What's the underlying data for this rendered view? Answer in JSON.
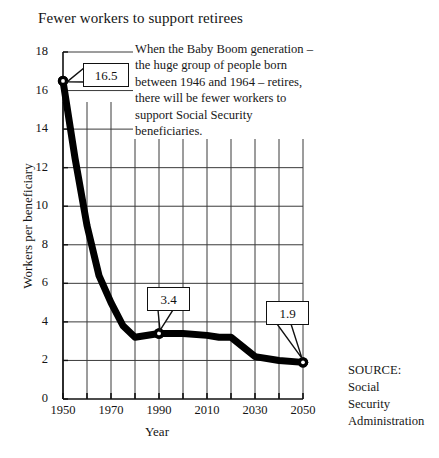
{
  "chart_data": {
    "type": "line",
    "title": "Fewer workers to support retirees",
    "xlabel": "Year",
    "ylabel": "Workers per beneficiary",
    "xlim": [
      1950,
      2050
    ],
    "ylim": [
      0,
      18
    ],
    "ytick_step": 2,
    "xtick_step": 10,
    "grid": true,
    "legend": "none",
    "x_major_ticks": [
      1950,
      1970,
      1990,
      2010,
      2030,
      2050
    ],
    "y_ticks": [
      0,
      2,
      4,
      6,
      8,
      10,
      12,
      14,
      16,
      18
    ],
    "x": [
      1950,
      1955,
      1960,
      1965,
      1970,
      1975,
      1980,
      1990,
      2000,
      2010,
      2015,
      2020,
      2030,
      2040,
      2050
    ],
    "values": [
      16.5,
      12.5,
      9.0,
      6.4,
      5.0,
      3.8,
      3.2,
      3.4,
      3.4,
      3.3,
      3.2,
      3.2,
      2.2,
      2.0,
      1.9
    ],
    "point_labels": [
      {
        "x": 1950,
        "y": 16.5,
        "label": "16.5"
      },
      {
        "x": 1990,
        "y": 3.4,
        "label": "3.4"
      },
      {
        "x": 2050,
        "y": 1.9,
        "label": "1.9"
      }
    ],
    "markers": [
      {
        "x": 1950,
        "y": 16.5
      },
      {
        "x": 1990,
        "y": 3.4
      },
      {
        "x": 2050,
        "y": 1.9
      }
    ],
    "annotation": "When the Baby Boom generation – the huge group of people born between 1946 and 1964 – retires, there will be fewer workers  to support Social Security beneficiaries.",
    "series_color": "#000000",
    "grid_color": "#3a3a3a"
  },
  "annotation": {
    "lines": [
      "When the Baby Boom generation",
      "– the huge group of people born",
      "between 1946 and 1964 – retires,",
      "there will be fewer workers  to",
      "support Social Security",
      "beneficiaries."
    ]
  },
  "source": {
    "label": "SOURCE:",
    "lines": [
      "Social",
      "Security",
      "Administration"
    ]
  }
}
